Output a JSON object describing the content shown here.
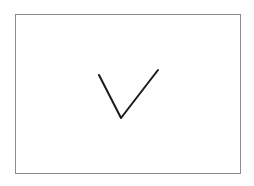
{
  "canvas": {
    "background": "#ffffff",
    "frame_color": "#8a8a8a",
    "stroke_color": "#1a1a1a"
  },
  "frame": {
    "x": 15,
    "y": 14,
    "width": 226,
    "height": 160
  },
  "checkmark": {
    "icon": "checkmark-icon",
    "points": [
      [
        99,
        75
      ],
      [
        121,
        118
      ],
      [
        158,
        70
      ]
    ]
  }
}
